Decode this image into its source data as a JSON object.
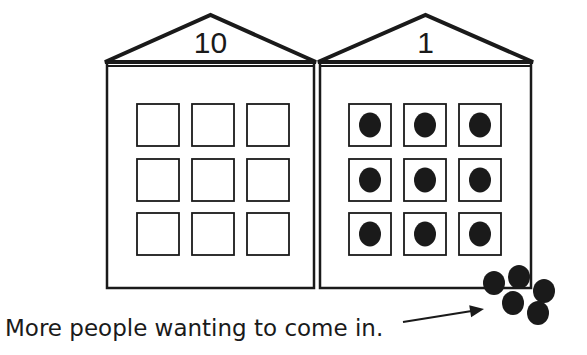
{
  "colors": {
    "ink": "#1a1a1a",
    "background": "#ffffff"
  },
  "houses": [
    {
      "id": "tens",
      "label": "10",
      "left": 107,
      "right": 314,
      "apex_y": 15,
      "eave_y": 62,
      "body_top": 66,
      "bottom": 288,
      "windows": {
        "cols_x": [
          137,
          192,
          247
        ],
        "rows_y": [
          104,
          159,
          213
        ],
        "size": 42,
        "filled": [
          false,
          false,
          false,
          false,
          false,
          false,
          false,
          false,
          false
        ]
      }
    },
    {
      "id": "ones",
      "label": "1",
      "left": 320,
      "right": 531,
      "apex_y": 15,
      "eave_y": 62,
      "body_top": 66,
      "bottom": 288,
      "windows": {
        "cols_x": [
          349,
          404,
          459
        ],
        "rows_y": [
          104,
          159,
          213
        ],
        "size": 42,
        "filled": [
          true,
          true,
          true,
          true,
          true,
          true,
          true,
          true,
          true
        ]
      }
    }
  ],
  "waiting_people": [
    {
      "cx": 494,
      "cy": 283
    },
    {
      "cx": 519,
      "cy": 277
    },
    {
      "cx": 544,
      "cy": 291
    },
    {
      "cx": 513,
      "cy": 303
    },
    {
      "cx": 538,
      "cy": 313
    }
  ],
  "caption": {
    "text": "More people wanting to come in.",
    "x": 5,
    "y": 336
  },
  "arrow": {
    "x1": 403,
    "y1": 322,
    "x2": 484,
    "y2": 309
  }
}
